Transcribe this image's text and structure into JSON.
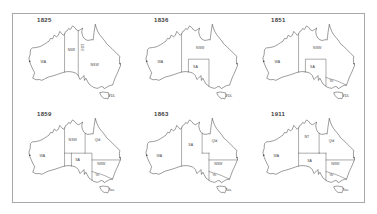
{
  "figure": {
    "background": "#ffffff",
    "frame_border_color": "#a8a8a8",
    "line_color": "#2f2f2f",
    "label_color": "#3f3f3f"
  },
  "maps": [
    {
      "year": "1825",
      "regions": [
        {
          "label": "WA",
          "x": 16,
          "y": 42
        },
        {
          "label": "NSW",
          "x": 45.6,
          "y": 30,
          "fs": 3.3
        },
        {
          "label": "135°E",
          "x": 55.2,
          "y": 26,
          "fs": 2.9,
          "rot": 90
        },
        {
          "label": "NSW",
          "x": 70,
          "y": 46
        },
        {
          "label": "VDL",
          "x": 88,
          "y": 79
        }
      ],
      "borders": [
        "m129",
        "m135"
      ]
    },
    {
      "year": "1836",
      "regions": [
        {
          "label": "WA",
          "x": 16,
          "y": 42
        },
        {
          "label": "NSW",
          "x": 58,
          "y": 28
        },
        {
          "label": "SA",
          "x": 53,
          "y": 48
        },
        {
          "label": "VDL",
          "x": 88,
          "y": 79
        }
      ],
      "borders": [
        "m129",
        "saBox"
      ]
    },
    {
      "year": "1851",
      "regions": [
        {
          "label": "WA",
          "x": 16,
          "y": 42
        },
        {
          "label": "NSW",
          "x": 58,
          "y": 28
        },
        {
          "label": "SA",
          "x": 53,
          "y": 48
        },
        {
          "label": "Vic",
          "x": 73,
          "y": 63,
          "fs": 3.1
        },
        {
          "label": "VDL",
          "x": 88,
          "y": 79
        }
      ],
      "borders": [
        "m129",
        "saBox",
        "vicLine"
      ]
    },
    {
      "year": "1859",
      "regions": [
        {
          "label": "WA",
          "x": 15,
          "y": 42
        },
        {
          "label": "NSW",
          "x": 47,
          "y": 26
        },
        {
          "label": "Qld",
          "x": 73,
          "y": 26
        },
        {
          "label": "SA",
          "x": 52,
          "y": 47
        },
        {
          "label": "NSW",
          "x": 77,
          "y": 51
        },
        {
          "label": "Vic",
          "x": 73,
          "y": 63,
          "fs": 3.1
        },
        {
          "label": "Tas.",
          "x": 88,
          "y": 79
        }
      ],
      "borders": [
        "m129",
        "saBox",
        "lat26a",
        "qld138",
        "lat29",
        "vicLine"
      ]
    },
    {
      "year": "1863",
      "regions": [
        {
          "label": "WA",
          "x": 15,
          "y": 42
        },
        {
          "label": "SA",
          "x": 48,
          "y": 31
        },
        {
          "label": "Qld",
          "x": 73,
          "y": 27
        },
        {
          "label": "NSW",
          "x": 77,
          "y": 51
        },
        {
          "label": "Vic",
          "x": 73,
          "y": 63,
          "fs": 3.1
        },
        {
          "label": "Tas.",
          "x": 88,
          "y": 79
        }
      ],
      "borders": [
        "m129",
        "m141s",
        "qld138",
        "qldStep",
        "lat29",
        "vicLine"
      ]
    },
    {
      "year": "1911",
      "regions": [
        {
          "label": "WA",
          "x": 15,
          "y": 42
        },
        {
          "label": "NT",
          "x": 47,
          "y": 22
        },
        {
          "label": "Qld",
          "x": 73,
          "y": 27
        },
        {
          "label": "SA",
          "x": 50,
          "y": 48
        },
        {
          "label": "NSW",
          "x": 77,
          "y": 51
        },
        {
          "label": "Vic",
          "x": 73,
          "y": 63,
          "fs": 3.1
        },
        {
          "label": "Tas.",
          "x": 88,
          "y": 79
        }
      ],
      "borders": [
        "m129",
        "m141s",
        "qld138",
        "qldStep",
        "lat26b",
        "lat29",
        "vicLine"
      ]
    }
  ]
}
